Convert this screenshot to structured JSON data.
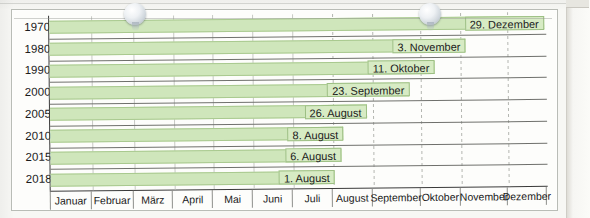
{
  "figure": {
    "name": "erntebeginn-weinlese-balkendiagramm",
    "frame_color": "#b9bcb6",
    "bar_fill": "#cfe6bb",
    "bar_border": "#a9c98f",
    "label_fill": "#d7ebc4"
  },
  "artifacts": [
    {
      "name": "bead-marker-left",
      "x": 135,
      "y": 14
    },
    {
      "name": "bead-marker-right",
      "x": 430,
      "y": 14
    }
  ],
  "chart_data": {
    "type": "bar",
    "orientation": "horizontal",
    "title": "",
    "subtitle": "",
    "xlabel": "",
    "ylabel": "",
    "grid": true,
    "legend": false,
    "categories": [
      "1970",
      "1980",
      "1990",
      "2000",
      "2005",
      "2010",
      "2015",
      "2018"
    ],
    "tick_labels_x": [
      "Januar",
      "Februar",
      "März",
      "April",
      "Mai",
      "Juni",
      "Juli",
      "August",
      "September",
      "Oktober",
      "November",
      "Dezember"
    ],
    "xlim": [
      "Januar",
      "Dezember"
    ],
    "values": [
      {
        "category": "1970",
        "label": "29. Dezember",
        "month": "Dezember",
        "day": 29,
        "day_of_year": 363
      },
      {
        "category": "1980",
        "label": "3. November",
        "month": "November",
        "day": 3,
        "day_of_year": 307
      },
      {
        "category": "1990",
        "label": "11. Oktober",
        "month": "Oktober",
        "day": 11,
        "day_of_year": 284
      },
      {
        "category": "2000",
        "label": "23. September",
        "month": "September",
        "day": 23,
        "day_of_year": 266
      },
      {
        "category": "2005",
        "label": "26. August",
        "month": "August",
        "day": 26,
        "day_of_year": 238
      },
      {
        "category": "2010",
        "label": "8. August",
        "month": "August",
        "day": 8,
        "day_of_year": 220
      },
      {
        "category": "2015",
        "label": "6. August",
        "month": "August",
        "day": 6,
        "day_of_year": 218
      },
      {
        "category": "2018",
        "label": "1. August",
        "month": "August",
        "day": 1,
        "day_of_year": 213
      }
    ]
  }
}
